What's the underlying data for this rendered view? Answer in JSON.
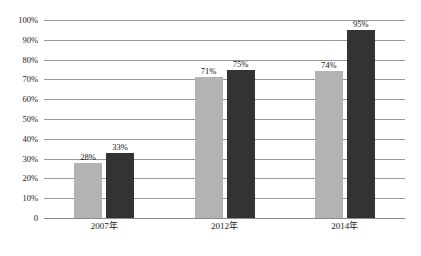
{
  "chart_data": {
    "type": "bar",
    "title": "",
    "subtitle": "",
    "xlabel": "",
    "ylabel": "",
    "categories": [
      "2007年",
      "2012年",
      "2014年"
    ],
    "series": [
      {
        "name": "series-1",
        "color": "#b3b3b3",
        "values": [
          28,
          71,
          74
        ],
        "labels": [
          "28%",
          "71%",
          "74%"
        ]
      },
      {
        "name": "series-2",
        "color": "#333333",
        "values": [
          33,
          75,
          95
        ],
        "labels": [
          "33%",
          "75%",
          "95%"
        ]
      }
    ],
    "ylim": [
      0,
      100
    ],
    "ytick_values": [
      0,
      10,
      20,
      30,
      40,
      50,
      60,
      70,
      80,
      90,
      100
    ],
    "ytick_labels": [
      "0",
      "10%",
      "20%",
      "30%",
      "40%",
      "50%",
      "60%",
      "70%",
      "80%",
      "90%",
      "100%"
    ],
    "grid": true,
    "gridline_color": "#9a9a9a",
    "legend": "none",
    "background": "#ffffff"
  }
}
